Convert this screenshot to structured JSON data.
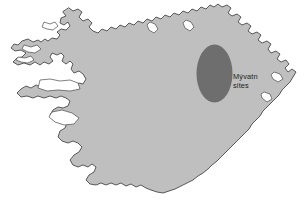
{
  "figure": {
    "name": "iceland-map",
    "width": 306,
    "height": 211,
    "background_color": "#ffffff"
  },
  "map": {
    "landmass_name": "Iceland",
    "land_fill_color": "#bfbfbf",
    "coastline_color": "#4a4a4a",
    "coastline_width": 0.9
  },
  "annotation": {
    "marker_name": "myvatn-sites-oval",
    "marker_fill_color": "#6e6e6e",
    "marker_center_x": 214.5,
    "marker_center_y": 73.5,
    "marker_radius_x": 18,
    "marker_radius_y": 29,
    "label_line1": "Mývatn",
    "label_line2": "sites",
    "label_x": 233,
    "label_line1_y": 79,
    "label_line2_y": 88,
    "label_color": "#1d1d1d"
  }
}
